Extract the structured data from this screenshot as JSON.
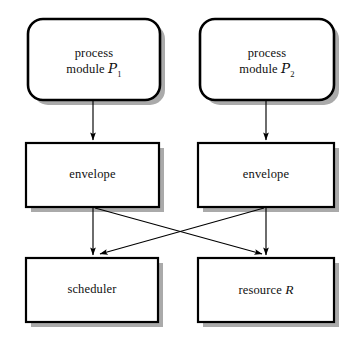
{
  "diagram": {
    "type": "flowchart",
    "title": "",
    "canvas": {
      "width": 353,
      "height": 343,
      "background": "#ffffff"
    },
    "style": {
      "node_fill": "#ffffff",
      "node_stroke": "#000000",
      "shadow_color": "#a9a9a9",
      "arrow_color": "#000000"
    },
    "nodes": [
      {
        "id": "process-module-1",
        "shape": "rounded-rect",
        "label_line1": "process",
        "label_line2_prefix": "module ",
        "label_symbol": "P",
        "label_subscript": "1",
        "label_plain": "process module P1",
        "x": 28,
        "y": 19,
        "w": 132,
        "h": 81
      },
      {
        "id": "process-module-2",
        "shape": "rounded-rect",
        "label_line1": "process",
        "label_line2_prefix": "module ",
        "label_symbol": "P",
        "label_subscript": "2",
        "label_plain": "process module P2",
        "x": 200,
        "y": 19,
        "w": 134,
        "h": 81
      },
      {
        "id": "envelope-left",
        "shape": "rect",
        "label_plain": "envelope",
        "x": 26,
        "y": 143,
        "w": 133,
        "h": 64
      },
      {
        "id": "envelope-right",
        "shape": "rect",
        "label_plain": "envelope",
        "x": 198,
        "y": 143,
        "w": 136,
        "h": 64
      },
      {
        "id": "scheduler",
        "shape": "rect",
        "label_plain": "scheduler",
        "x": 26,
        "y": 258,
        "w": 132,
        "h": 64
      },
      {
        "id": "resource",
        "shape": "rect",
        "label_prefix": "resource ",
        "label_symbol": "R",
        "label_plain": "resource R",
        "x": 198,
        "y": 258,
        "w": 136,
        "h": 64
      }
    ],
    "edges": [
      {
        "id": "edge-pm1-env1",
        "from": "process-module-1",
        "to": "envelope-left",
        "kind": "straight-down"
      },
      {
        "id": "edge-pm2-env2",
        "from": "process-module-2",
        "to": "envelope-right",
        "kind": "straight-down"
      },
      {
        "id": "edge-env1-scheduler",
        "from": "envelope-left",
        "to": "scheduler",
        "kind": "straight-down"
      },
      {
        "id": "edge-env2-resource",
        "from": "envelope-right",
        "to": "resource",
        "kind": "straight-down"
      },
      {
        "id": "edge-env1-resource",
        "from": "envelope-left",
        "to": "resource",
        "kind": "diagonal-cross"
      },
      {
        "id": "edge-env2-scheduler",
        "from": "envelope-right",
        "to": "scheduler",
        "kind": "diagonal-cross"
      }
    ]
  }
}
